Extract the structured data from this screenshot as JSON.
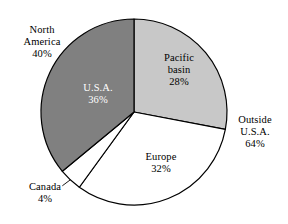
{
  "chart_data": {
    "type": "pie",
    "title": "",
    "subtitle": "",
    "xlabel": "",
    "ylabel": "",
    "legend_position": "none",
    "grid": false,
    "total_percent": 100,
    "start_angle_deg": 0,
    "direction": "clockwise",
    "categories": [
      "Pacific basin",
      "Europe",
      "Canada",
      "U.S.A."
    ],
    "values": [
      28,
      32,
      4,
      36
    ],
    "slices": [
      {
        "name": "Pacific basin",
        "label_line1": "Pacific",
        "label_line2": "basin",
        "value": 28,
        "value_label": "28%",
        "color": "#c8c8c8",
        "label_placement": "inside",
        "label_color": "#000000",
        "start_deg": 0,
        "end_deg": 100.8
      },
      {
        "name": "Europe",
        "label_line1": "Europe",
        "label_line2": "",
        "value": 32,
        "value_label": "32%",
        "color": "#ffffff",
        "label_placement": "inside",
        "label_color": "#000000",
        "start_deg": 100.8,
        "end_deg": 216.0
      },
      {
        "name": "Canada",
        "label_line1": "Canada",
        "label_line2": "",
        "value": 4,
        "value_label": "4%",
        "color": "#ffffff",
        "label_placement": "outside",
        "label_color": "#000000",
        "start_deg": 216.0,
        "end_deg": 230.4
      },
      {
        "name": "U.S.A.",
        "label_line1": "U.S.A.",
        "label_line2": "",
        "value": 36,
        "value_label": "36%",
        "color": "#808080",
        "label_placement": "inside",
        "label_color": "#ffffff",
        "start_deg": 230.4,
        "end_deg": 360.0
      }
    ],
    "groupings": [
      {
        "name": "North America",
        "label_line1": "North",
        "label_line2": "America",
        "value": 40,
        "value_label": "40%",
        "members": [
          "U.S.A.",
          "Canada"
        ]
      },
      {
        "name": "Outside U.S.A.",
        "label_line1": "Outside",
        "label_line2": "U.S.A.",
        "value": 64,
        "value_label": "64%",
        "members": [
          "Pacific basin",
          "Europe",
          "Canada"
        ]
      }
    ],
    "annotations": [
      "North America 40%",
      "Outside U.S.A. 64%",
      "U.S.A. 36%",
      "Pacific basin 28%",
      "Europe 32%",
      "Canada 4%"
    ],
    "colors": {
      "dark_gray": "#808080",
      "light_gray": "#c8c8c8",
      "white": "#ffffff",
      "outline": "#000000",
      "background": "#ffffff"
    }
  }
}
